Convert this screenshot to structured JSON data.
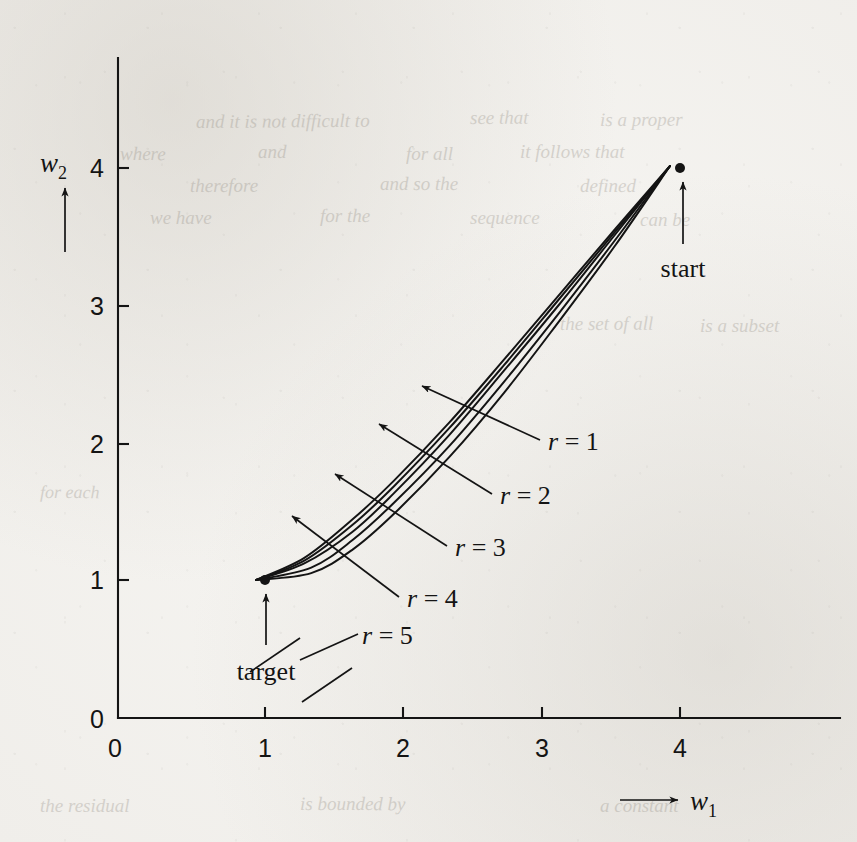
{
  "figure": {
    "kind": "scanned-book-figure",
    "background_color": "#f4f3f0",
    "ink_color": "#141414",
    "axis_labels": {
      "x_name": "w",
      "x_sub": "1",
      "y_name": "w",
      "y_sub": "2"
    },
    "point_labels": {
      "start": "start",
      "target": "target"
    },
    "curve_labels": [
      {
        "text": "r = 1",
        "lhs": "r",
        "eq": " = ",
        "rhs": "1"
      },
      {
        "text": "r = 2",
        "lhs": "r",
        "eq": " = ",
        "rhs": "2"
      },
      {
        "text": "r = 3",
        "lhs": "r",
        "eq": " = ",
        "rhs": "3"
      },
      {
        "text": "r = 4",
        "lhs": "r",
        "eq": " = ",
        "rhs": "4"
      },
      {
        "text": "r = 5",
        "lhs": "r",
        "eq": " = ",
        "rhs": "5"
      }
    ],
    "ghost_text": [
      {
        "text": "and it is not difficult to",
        "x": 196,
        "y": 128,
        "size": 19,
        "rot": -0.4
      },
      {
        "text": "see that",
        "x": 470,
        "y": 124,
        "size": 19,
        "rot": -0.3
      },
      {
        "text": "is a proper",
        "x": 600,
        "y": 126,
        "size": 19,
        "rot": -0.2
      },
      {
        "text": "where",
        "x": 120,
        "y": 160,
        "size": 19,
        "rot": 0.2
      },
      {
        "text": "and",
        "x": 258,
        "y": 158,
        "size": 19,
        "rot": 0.1
      },
      {
        "text": "for all",
        "x": 406,
        "y": 160,
        "size": 19,
        "rot": 0.0
      },
      {
        "text": "it follows that",
        "x": 520,
        "y": 158,
        "size": 19,
        "rot": 0.0
      },
      {
        "text": "therefore",
        "x": 190,
        "y": 192,
        "size": 19,
        "rot": -0.2
      },
      {
        "text": "and so the",
        "x": 380,
        "y": 190,
        "size": 19,
        "rot": -0.1
      },
      {
        "text": "defined",
        "x": 580,
        "y": 192,
        "size": 19,
        "rot": 0.1
      },
      {
        "text": "we have",
        "x": 150,
        "y": 224,
        "size": 19,
        "rot": 0.0
      },
      {
        "text": "for the",
        "x": 320,
        "y": 222,
        "size": 19,
        "rot": 0.1
      },
      {
        "text": "sequence",
        "x": 470,
        "y": 224,
        "size": 19,
        "rot": 0.0
      },
      {
        "text": "can be",
        "x": 640,
        "y": 226,
        "size": 19,
        "rot": 0.0
      },
      {
        "text": "the set of all",
        "x": 560,
        "y": 330,
        "size": 19,
        "rot": -0.2
      },
      {
        "text": "is a subset",
        "x": 700,
        "y": 332,
        "size": 19,
        "rot": 0.0
      },
      {
        "text": "for each",
        "x": 40,
        "y": 498,
        "size": 18,
        "rot": 0.2
      },
      {
        "text": "the residual",
        "x": 40,
        "y": 812,
        "size": 19,
        "rot": 0.0
      },
      {
        "text": "is bounded by",
        "x": 300,
        "y": 810,
        "size": 19,
        "rot": 0.1
      },
      {
        "text": "a constant",
        "x": 600,
        "y": 812,
        "size": 19,
        "rot": 0.0
      }
    ]
  },
  "chart_data": {
    "type": "line",
    "title": "",
    "xlabel": "w1",
    "ylabel": "w2",
    "xlim": [
      0,
      5.3
    ],
    "ylim": [
      0,
      4.55
    ],
    "xticks": [
      0,
      1,
      2,
      3,
      4
    ],
    "xticklabels": [
      "0",
      "1",
      "2",
      "3",
      "4"
    ],
    "yticks": [
      0,
      1,
      2,
      3,
      4
    ],
    "yticklabels": [
      "0",
      "1",
      "2",
      "3",
      "4"
    ],
    "grid": false,
    "legend": "none (inline leader-line annotations)",
    "annotated_points": [
      {
        "name": "start",
        "x": 4,
        "y": 4
      },
      {
        "name": "target",
        "x": 1,
        "y": 1
      }
    ],
    "series": [
      {
        "name": "r = 1",
        "points": [
          [
            4,
            4
          ],
          [
            3.6,
            3.42
          ],
          [
            3.2,
            2.88
          ],
          [
            2.8,
            2.36
          ],
          [
            2.4,
            1.89
          ],
          [
            2.0,
            1.48
          ],
          [
            1.7,
            1.22
          ],
          [
            1.4,
            1.05
          ],
          [
            1.0,
            1.0
          ]
        ]
      },
      {
        "name": "r = 2",
        "points": [
          [
            4,
            4
          ],
          [
            3.6,
            3.46
          ],
          [
            3.2,
            2.94
          ],
          [
            2.8,
            2.44
          ],
          [
            2.4,
            1.97
          ],
          [
            2.0,
            1.56
          ],
          [
            1.7,
            1.29
          ],
          [
            1.4,
            1.09
          ],
          [
            1.0,
            1.0
          ]
        ]
      },
      {
        "name": "r = 3",
        "points": [
          [
            4,
            4
          ],
          [
            3.6,
            3.5
          ],
          [
            3.2,
            3.0
          ],
          [
            2.8,
            2.52
          ],
          [
            2.4,
            2.05
          ],
          [
            2.0,
            1.63
          ],
          [
            1.7,
            1.35
          ],
          [
            1.35,
            1.12
          ],
          [
            1.0,
            1.0
          ]
        ]
      },
      {
        "name": "r = 4",
        "points": [
          [
            4,
            4
          ],
          [
            3.6,
            3.52
          ],
          [
            3.2,
            3.04
          ],
          [
            2.8,
            2.56
          ],
          [
            2.4,
            2.1
          ],
          [
            2.0,
            1.68
          ],
          [
            1.7,
            1.4
          ],
          [
            1.35,
            1.14
          ],
          [
            1.0,
            1.0
          ]
        ]
      },
      {
        "name": "r = 5",
        "points": [
          [
            4,
            4
          ],
          [
            3.6,
            3.54
          ],
          [
            3.2,
            3.07
          ],
          [
            2.8,
            2.6
          ],
          [
            2.4,
            2.14
          ],
          [
            2.0,
            1.72
          ],
          [
            1.7,
            1.44
          ],
          [
            1.35,
            1.16
          ],
          [
            1.0,
            1.0
          ]
        ]
      }
    ]
  },
  "geometry": {
    "origin_px": [
      118,
      718
    ],
    "unit_px": 138,
    "x_axis_end_px": 840,
    "y_axis_top_px": 58,
    "tick_len_px": 11,
    "label_anchors_px": [
      {
        "name": "r = 1",
        "tx": 548,
        "ty": 448,
        "ax": 418,
        "ay": 382
      },
      {
        "name": "r = 2",
        "tx": 500,
        "ty": 501,
        "ax": 375,
        "ay": 420
      },
      {
        "name": "r = 3",
        "tx": 455,
        "ty": 553,
        "ax": 331,
        "ay": 470
      },
      {
        "name": "r = 4",
        "tx": 407,
        "ty": 604,
        "ax": 288,
        "ay": 512
      },
      {
        "name": "r = 5",
        "tx": 362,
        "ty": 640,
        "ax": 300,
        "ay": 646
      }
    ]
  }
}
